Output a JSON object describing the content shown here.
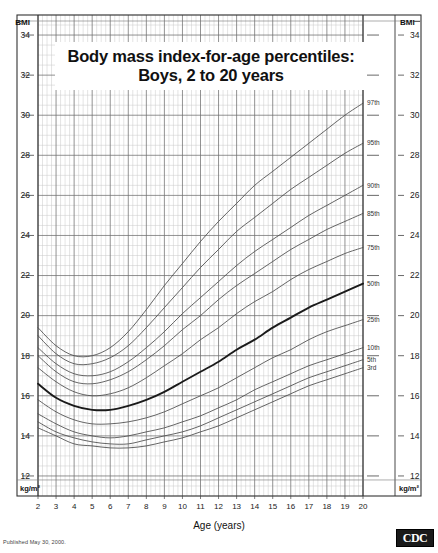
{
  "title": {
    "line1": "Body mass index-for-age percentiles:",
    "line2": "Boys, 2 to 20 years"
  },
  "footer": {
    "published": "Published May 30, 2000.",
    "logo": "CDC"
  },
  "axes": {
    "y_header_left": "BMI",
    "y_header_right": "BMI",
    "y_unit_left": "kg/m²",
    "y_unit_right": "kg/m²",
    "x_title": "Age (years)"
  },
  "chart_data": {
    "type": "line",
    "title": "Body mass index-for-age percentiles: Boys, 2 to 20 years",
    "xlabel": "Age (years)",
    "ylabel": "BMI",
    "yunit": "kg/m²",
    "xlim": [
      2,
      20
    ],
    "ylim": [
      11,
      35
    ],
    "grid": true,
    "grid_major_x_step": 1,
    "grid_minor_x_step": 0.25,
    "grid_major_y_step": 2,
    "grid_minor_y_step": 0.5,
    "xticks": [
      2,
      3,
      4,
      5,
      6,
      7,
      8,
      9,
      10,
      11,
      12,
      13,
      14,
      15,
      16,
      17,
      18,
      19,
      20
    ],
    "yticks": [
      12,
      14,
      16,
      18,
      20,
      22,
      24,
      26,
      28,
      30,
      32,
      34
    ],
    "ytick_labels": [
      "12",
      "14",
      "16",
      "18",
      "20",
      "22",
      "24",
      "26",
      "28",
      "30",
      "32",
      "34"
    ],
    "xtick_labels": [
      "2",
      "3",
      "4",
      "5",
      "6",
      "7",
      "8",
      "9",
      "10",
      "11",
      "12",
      "13",
      "14",
      "15",
      "16",
      "17",
      "18",
      "19",
      "20"
    ],
    "legend_position": "right-inline-curve-labels",
    "x": [
      2,
      3,
      4,
      5,
      6,
      7,
      8,
      9,
      10,
      11,
      12,
      13,
      14,
      15,
      16,
      17,
      18,
      19,
      20
    ],
    "series": [
      {
        "name": "97th",
        "label": "97th",
        "emphasis": false,
        "values": [
          19.4,
          18.5,
          18.0,
          18.0,
          18.4,
          19.2,
          20.3,
          21.5,
          22.6,
          23.7,
          24.7,
          25.6,
          26.5,
          27.2,
          27.9,
          28.6,
          29.3,
          30.0,
          30.6
        ]
      },
      {
        "name": "95th",
        "label": "95th",
        "emphasis": false,
        "values": [
          19.0,
          18.1,
          17.6,
          17.6,
          17.9,
          18.5,
          19.4,
          20.4,
          21.4,
          22.4,
          23.3,
          24.2,
          24.9,
          25.6,
          26.3,
          26.9,
          27.5,
          28.1,
          28.6
        ]
      },
      {
        "name": "90th",
        "label": "90th",
        "emphasis": false,
        "values": [
          18.4,
          17.6,
          17.1,
          17.0,
          17.2,
          17.7,
          18.4,
          19.2,
          20.1,
          20.9,
          21.7,
          22.5,
          23.2,
          23.8,
          24.4,
          25.0,
          25.5,
          26.0,
          26.5
        ]
      },
      {
        "name": "85th",
        "label": "85th",
        "emphasis": false,
        "values": [
          18.0,
          17.2,
          16.7,
          16.6,
          16.8,
          17.2,
          17.8,
          18.5,
          19.3,
          20.0,
          20.8,
          21.5,
          22.1,
          22.7,
          23.3,
          23.8,
          24.3,
          24.7,
          25.1
        ]
      },
      {
        "name": "75th",
        "label": "75th",
        "emphasis": false,
        "values": [
          17.4,
          16.7,
          16.2,
          16.0,
          16.1,
          16.4,
          16.9,
          17.5,
          18.1,
          18.8,
          19.4,
          20.1,
          20.7,
          21.2,
          21.8,
          22.3,
          22.7,
          23.1,
          23.4
        ]
      },
      {
        "name": "50th",
        "label": "50th",
        "emphasis": true,
        "values": [
          16.6,
          15.9,
          15.5,
          15.3,
          15.3,
          15.5,
          15.8,
          16.2,
          16.7,
          17.2,
          17.7,
          18.3,
          18.8,
          19.4,
          19.9,
          20.4,
          20.8,
          21.2,
          21.6
        ]
      },
      {
        "name": "25th",
        "label": "25th",
        "emphasis": false,
        "values": [
          15.8,
          15.2,
          14.8,
          14.6,
          14.6,
          14.7,
          14.9,
          15.2,
          15.6,
          16.0,
          16.4,
          16.9,
          17.4,
          17.9,
          18.3,
          18.8,
          19.2,
          19.5,
          19.8
        ]
      },
      {
        "name": "10th",
        "label": "10th",
        "emphasis": false,
        "values": [
          15.1,
          14.6,
          14.2,
          14.0,
          13.9,
          14.0,
          14.2,
          14.4,
          14.7,
          15.0,
          15.4,
          15.8,
          16.3,
          16.7,
          17.1,
          17.5,
          17.8,
          18.1,
          18.4
        ]
      },
      {
        "name": "5th",
        "label": "5th",
        "emphasis": false,
        "values": [
          14.7,
          14.2,
          13.9,
          13.7,
          13.6,
          13.6,
          13.8,
          14.0,
          14.2,
          14.5,
          14.9,
          15.3,
          15.7,
          16.1,
          16.5,
          16.9,
          17.2,
          17.5,
          17.8
        ]
      },
      {
        "name": "3rd",
        "label": "3rd",
        "emphasis": false,
        "values": [
          14.4,
          14.0,
          13.6,
          13.5,
          13.4,
          13.4,
          13.5,
          13.7,
          13.9,
          14.2,
          14.5,
          14.9,
          15.3,
          15.7,
          16.1,
          16.5,
          16.8,
          17.1,
          17.4
        ]
      }
    ]
  },
  "colors": {
    "curve": "#4a4a4a",
    "curve_emphasis": "#1a1a1a",
    "grid_major": "#6e6e6e",
    "grid_minor": "#c9c9c9",
    "frame": "#333333",
    "background": "#ffffff"
  }
}
